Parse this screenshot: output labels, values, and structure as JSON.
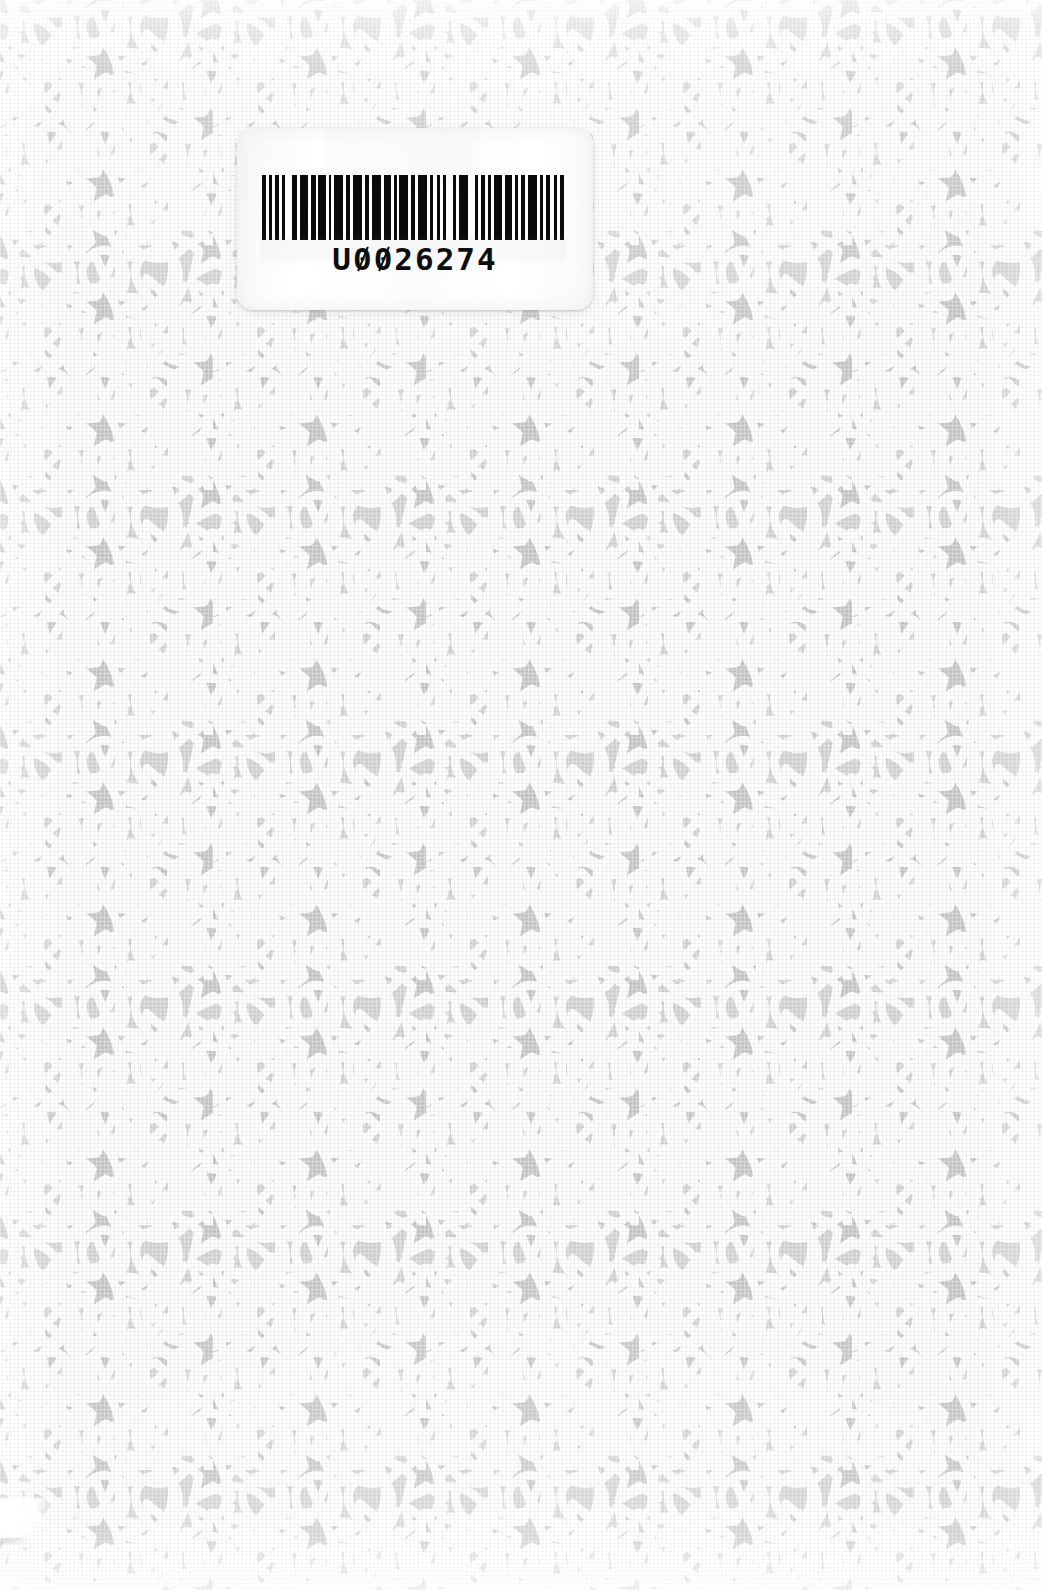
{
  "document": {
    "kind": "scanned-book-cover",
    "width_px": 1042,
    "height_px": 1590,
    "description": "Back cover of a book scanned flat; light grey fabric-textured ground printed with a white Islamic geometric interlace (five-pointed star rosettes linked by teardrop petal loops); a white rounded-corner library barcode label is affixed near the upper left."
  },
  "colors": {
    "paper_grey": "#d5d5d5",
    "pattern_white": "#ffffff",
    "motif_shadow": "#c6c6c6",
    "label_white": "#fdfdfd",
    "barcode_ink": "#0a0a0a"
  },
  "pattern": {
    "name": "islamic-interlace-pattern",
    "motif": "five-pointed star rosette",
    "secondary_motif": "teardrop petal loop",
    "line_color": "#ffffff",
    "ground_color": "#d5d5d5",
    "tile_width_px": 213,
    "tile_height_px": 245,
    "stroke_width_px": 9
  },
  "label": {
    "name": "library-barcode-label",
    "x": 237,
    "y": 128,
    "width": 356,
    "height": 182,
    "corner_radius": 16,
    "background": "#fdfdfd",
    "barcode": {
      "symbology": "code-39",
      "human_readable_text": "U0026274",
      "prefix_letter": "U",
      "digits": "0026274",
      "bar_color": "#0a0a0a",
      "quiet_zone": true,
      "bar_widths": [
        3,
        2,
        2,
        2,
        3,
        2,
        2,
        5,
        3,
        2,
        6,
        2,
        3,
        2,
        5,
        2,
        2,
        2,
        6,
        2,
        3,
        2,
        6,
        2,
        3,
        2,
        6,
        2,
        5,
        2,
        2,
        2,
        6,
        2,
        3,
        2,
        6,
        2,
        2,
        3,
        2,
        2,
        2,
        5,
        2,
        2,
        6,
        5,
        2,
        2,
        3,
        2,
        2,
        2,
        6,
        2,
        5,
        2,
        2,
        2,
        3,
        2,
        6,
        2,
        2,
        2,
        3,
        3,
        2,
        2,
        3,
        2
      ]
    }
  },
  "artifacts": {
    "edge_curl": {
      "name": "page-edge-curl",
      "position": "bottom-left",
      "x": 0,
      "y": 1498,
      "width": 62,
      "height": 40
    },
    "scan_bloom_top": true,
    "scan_bloom_bottom": true
  }
}
